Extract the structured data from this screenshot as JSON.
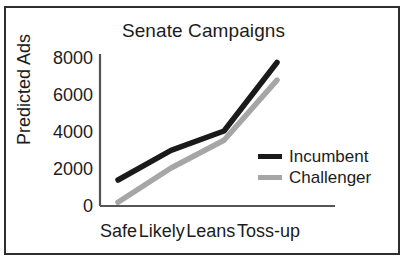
{
  "figure": {
    "border_color": "#2e2e2e",
    "background": "#ffffff"
  },
  "chart_data": {
    "type": "line",
    "title": "Senate Campaigns",
    "xlabel": "",
    "ylabel": "Predicted Ads",
    "categories": [
      "Safe",
      "Likely",
      "Leans",
      "Toss-up"
    ],
    "yticks": [
      "0",
      "2000",
      "4000",
      "6000",
      "8000"
    ],
    "ylim": [
      0,
      8000
    ],
    "xlim": [
      0,
      3
    ],
    "grid": false,
    "legend_position": "center right",
    "series": [
      {
        "name": "Incumbent",
        "color": "#1a1a1a",
        "values": [
          1350,
          2950,
          4000,
          7700
        ]
      },
      {
        "name": "Challenger",
        "color": "#a6a6a6",
        "values": [
          150,
          2000,
          3500,
          6750
        ]
      }
    ]
  }
}
